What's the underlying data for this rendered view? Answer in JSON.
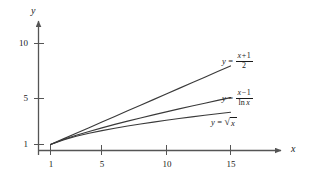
{
  "figure": {
    "background_color": "#ffffff",
    "line_color": "#3a3a3a",
    "axis_color": "#555555",
    "text_color": "#1a1a1a"
  },
  "axes": {
    "x_name": "x",
    "y_name": "y",
    "x_ticks": [
      "1",
      "5",
      "10",
      "15"
    ],
    "y_ticks": [
      "1",
      "5",
      "10"
    ]
  },
  "labels": {
    "curve1": {
      "lhs": "y",
      "equals": "=",
      "numerator_x": "x",
      "numerator_op": "+",
      "numerator_one": "1",
      "denominator": "2"
    },
    "curve2": {
      "lhs": "y",
      "equals": "=",
      "numerator_x": "x",
      "numerator_op": "−",
      "numerator_one": "1",
      "denominator_fn": "ln",
      "denominator_arg": "x"
    },
    "curve3": {
      "lhs": "y",
      "equals": "=",
      "radical_sign": "√",
      "radicand": "x"
    }
  },
  "chart_data": {
    "type": "line",
    "title": "",
    "xlabel": "x",
    "ylabel": "y",
    "xlim": [
      0,
      17.5
    ],
    "ylim": [
      0,
      11.5
    ],
    "grid": false,
    "legend": "inline-annotations",
    "xticks": [
      1,
      5,
      10,
      15
    ],
    "yticks": [
      1,
      5,
      10
    ],
    "x": [
      1,
      2,
      3,
      4,
      5,
      6,
      7,
      8,
      9,
      10,
      11,
      12,
      13,
      14,
      15
    ],
    "series": [
      {
        "name": "y = (x + 1) / 2",
        "expression": "(x+1)/2",
        "values": [
          1,
          1.5,
          2,
          2.5,
          3,
          3.5,
          4,
          4.5,
          5,
          5.5,
          6,
          6.5,
          7,
          7.5,
          8
        ]
      },
      {
        "name": "y = (x - 1) / ln x",
        "expression": "(x-1)/ln(x)",
        "values": [
          1,
          1.443,
          1.82,
          2.164,
          2.485,
          2.791,
          3.084,
          3.366,
          3.64,
          3.909,
          4.17,
          4.427,
          4.68,
          4.928,
          5.172
        ]
      },
      {
        "name": "y = sqrt(x)",
        "expression": "sqrt(x)",
        "values": [
          1,
          1.414,
          1.732,
          2,
          2.236,
          2.449,
          2.646,
          2.828,
          3,
          3.162,
          3.317,
          3.464,
          3.606,
          3.742,
          3.873
        ]
      }
    ]
  }
}
